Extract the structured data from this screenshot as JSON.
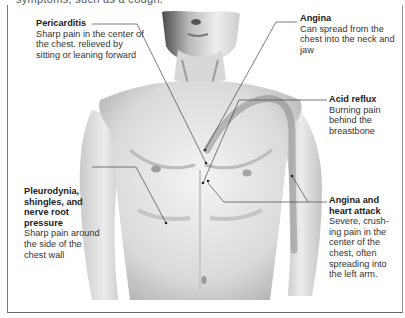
{
  "header": {
    "cutoff_text": "symptoms, such as a cough."
  },
  "diagram": {
    "callouts": [
      {
        "id": "pericarditis",
        "title": "Pericarditis",
        "description": "Sharp pain in the center of the chest. relieved by sitting or leaning forward"
      },
      {
        "id": "angina",
        "title": "Angina",
        "description": "Can spread from the chest into the neck and jaw"
      },
      {
        "id": "acid-reflux",
        "title": "Acid reflux",
        "description": "Burning pain behind the breastbone"
      },
      {
        "id": "pleurodynia",
        "title": "Pleurodynia, shingles, and nerve root pressure",
        "description": "Sharp pain around the side of the chest wall"
      },
      {
        "id": "heart-attack",
        "title": "Angina and heart attack",
        "description": "Severe, crush-ing pain in the center of the chest, often spreading into the left arm."
      }
    ]
  },
  "colors": {
    "text": "#2a2a2a",
    "leader_line": "#444444",
    "skin_light": "#e8e8e8",
    "skin_shadow": "#9a9a9a",
    "highlight_path": "#7a7a7a"
  }
}
